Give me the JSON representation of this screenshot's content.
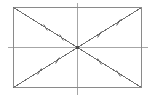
{
  "figure": {
    "background_color": "#ffffff",
    "canvas": {
      "width": 155,
      "height": 98
    }
  },
  "colors": {
    "rectangle_stroke": "#8a8a8a",
    "diagonal_stroke": "#6e6e6e",
    "centerline_stroke": "#a6a6a6",
    "tick_stroke": "#5a5a5a",
    "center_point": "#4a4a4a"
  },
  "strokes": {
    "rectangle_width": 1,
    "diagonal_width": 1,
    "centerline_width": 1,
    "tick_width": 1
  },
  "rectangle": {
    "label": "rectangle",
    "x": 13.5,
    "y": 7.5,
    "width": 128,
    "height": 80,
    "corners": {
      "top_left": [
        13.5,
        7.5
      ],
      "top_right": [
        141.5,
        7.5
      ],
      "bottom_right": [
        141.5,
        87.5
      ],
      "bottom_left": [
        13.5,
        87.5
      ]
    }
  },
  "center": {
    "label": "intersection-point",
    "x": 77.5,
    "y": 47.5,
    "radius": 1.6
  },
  "centerlines": [
    {
      "name": "vertical-axis-of-symmetry",
      "orientation": "vertical",
      "x1": 77.5,
      "y1": 2.5,
      "x2": 77.5,
      "y2": 94.5
    },
    {
      "name": "horizontal-axis-of-symmetry",
      "orientation": "horizontal",
      "x1": 7.5,
      "y1": 47.5,
      "x2": 147.5,
      "y2": 47.5
    }
  ],
  "diagonals": [
    {
      "name": "diagonal-top-left-to-bottom-right",
      "x1": 13.5,
      "y1": 7.5,
      "x2": 141.5,
      "y2": 87.5
    },
    {
      "name": "diagonal-bottom-left-to-top-right",
      "x1": 13.5,
      "y1": 87.5,
      "x2": 141.5,
      "y2": 7.5
    }
  ],
  "tick_marks": {
    "description": "double hash marks on each diagonal half-segment denoting congruent halves",
    "per_segment": 2,
    "total": 8,
    "length": 7,
    "segments": [
      {
        "name": "tick-upper-left-outer",
        "cx": 45.5,
        "cy": 27.5,
        "angle_deg": 58
      },
      {
        "name": "tick-upper-left-inner",
        "cx": 61.5,
        "cy": 37.5,
        "angle_deg": 58
      },
      {
        "name": "tick-lower-right-inner",
        "cx": 99.5,
        "cy": 61.5,
        "angle_deg": 58
      },
      {
        "name": "tick-lower-right-outer",
        "cx": 118.5,
        "cy": 73.5,
        "angle_deg": 58
      },
      {
        "name": "tick-lower-left-outer",
        "cx": 39.5,
        "cy": 71.5,
        "angle_deg": 122
      },
      {
        "name": "tick-lower-left-inner",
        "cx": 57.5,
        "cy": 60.5,
        "angle_deg": 122
      },
      {
        "name": "tick-upper-right-inner",
        "cx": 99.5,
        "cy": 34.5,
        "angle_deg": 122
      },
      {
        "name": "tick-upper-right-outer",
        "cx": 118.5,
        "cy": 22.5,
        "angle_deg": 122
      }
    ]
  }
}
